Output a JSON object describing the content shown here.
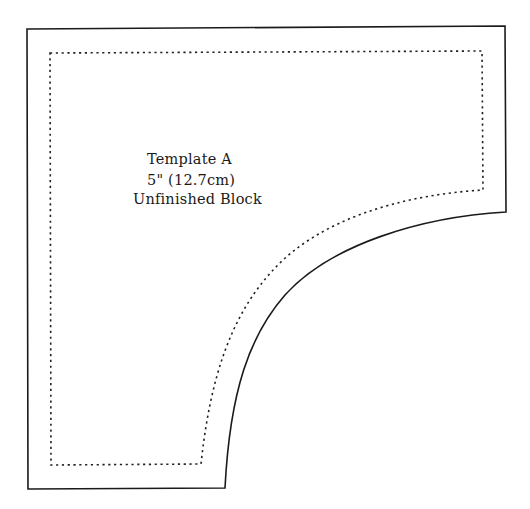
{
  "template": {
    "title": "Template A",
    "size": "5\" (12.7cm)",
    "subtitle": "Unfinished Block"
  },
  "colors": {
    "cut_line": "#1a1a1a",
    "seam_line": "#222222",
    "background": "#ffffff"
  },
  "lines": {
    "cut_line": "solid",
    "seam_line": "dotted"
  }
}
